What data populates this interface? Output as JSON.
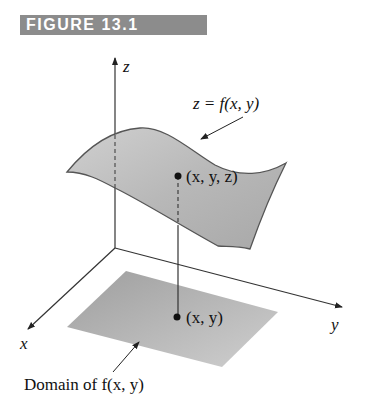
{
  "figure": {
    "header": "FIGURE 13.1",
    "header_color": "#8c8c8c"
  },
  "axes": {
    "z_label": "z",
    "x_label": "x",
    "y_label": "y"
  },
  "labels": {
    "surface_eq": "z = f(x, y)",
    "surface_point": "(x, y, z)",
    "domain_point": "(x, y)",
    "domain_caption": "Domain of f(x, y)"
  },
  "colors": {
    "surface_fill": "#bdbdbd",
    "domain_fill": "#b0b0b0",
    "line": "#333333"
  }
}
